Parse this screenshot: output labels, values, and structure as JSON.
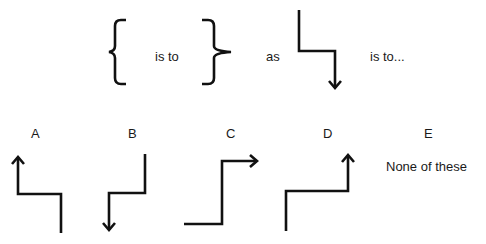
{
  "question": {
    "term1": "left-curly-brace",
    "relation1": "is to",
    "term2": "right-curly-brace",
    "connector": "as",
    "term3": "step-down-arrow",
    "relation2": "is to..."
  },
  "options": [
    {
      "label": "A",
      "shape": "step-arrow-up-left"
    },
    {
      "label": "B",
      "shape": "step-arrow-down-left"
    },
    {
      "label": "C",
      "shape": "step-arrow-right-up"
    },
    {
      "label": "D",
      "shape": "step-arrow-up-right"
    },
    {
      "label": "E",
      "text": "None of these"
    }
  ],
  "colors": {
    "stroke": "#111111",
    "background": "#ffffff"
  }
}
